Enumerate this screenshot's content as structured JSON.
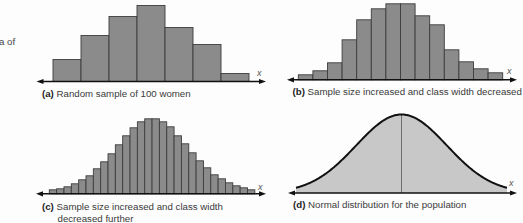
{
  "figure": {
    "side_text_fragment": "a of"
  },
  "panels": [
    {
      "id": "a",
      "tag": "(a)",
      "caption_lines": [
        "Random sample of 100 women"
      ]
    },
    {
      "id": "b",
      "tag": "(b)",
      "caption_lines": [
        "Sample size increased and class width decreased"
      ]
    },
    {
      "id": "c",
      "tag": "(c)",
      "caption_lines": [
        "Sample size increased and class width",
        "decreased further"
      ]
    },
    {
      "id": "d",
      "tag": "(d)",
      "caption_lines": [
        "Normal distribution for the population"
      ]
    }
  ],
  "colors": {
    "bar_fill": "#8b8b8b",
    "bar_stroke": "#3d3d3d",
    "curve_fill": "#c8c8c8",
    "curve_stroke": "#111111",
    "mean_line": "#707070",
    "axis": "#111111"
  },
  "chart_data": [
    {
      "type": "bar",
      "panel": "a",
      "title": "(a) Random sample of 100 women",
      "xlabel": "x",
      "ylabel": "",
      "values": [
        22,
        46,
        65,
        76,
        54,
        37,
        8
      ],
      "ylim": [
        0,
        80
      ],
      "grid": false
    },
    {
      "type": "bar",
      "panel": "b",
      "title": "(b) Sample size increased and class width decreased",
      "xlabel": "x",
      "ylabel": "",
      "values": [
        5,
        9,
        17,
        40,
        60,
        71,
        76,
        76,
        64,
        55,
        30,
        18,
        11,
        7
      ],
      "ylim": [
        0,
        80
      ],
      "grid": false
    },
    {
      "type": "bar",
      "panel": "c",
      "title": "(c) Sample size increased and class width decreased further",
      "xlabel": "x",
      "ylabel": "",
      "values": [
        4,
        5,
        7,
        10,
        14,
        18,
        25,
        32,
        40,
        49,
        58,
        66,
        72,
        75,
        75,
        72,
        67,
        58,
        50,
        41,
        33,
        26,
        19,
        15,
        11,
        8,
        6,
        4
      ],
      "ylim": [
        0,
        80
      ],
      "grid": false
    },
    {
      "type": "area",
      "panel": "d",
      "title": "(d) Normal distribution for the population",
      "xlabel": "x",
      "ylabel": "",
      "distribution": "normal",
      "peak": 78.5,
      "x_range_sd": [
        -2.33,
        2.33
      ],
      "mean_line": true,
      "ylim": [
        0,
        80
      ],
      "grid": false
    }
  ]
}
